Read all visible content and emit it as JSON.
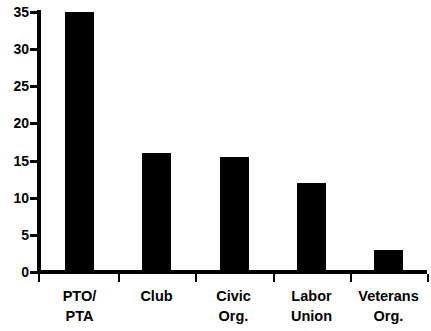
{
  "chart_data": {
    "type": "bar",
    "title": "",
    "subtitle": "",
    "xlabel": "",
    "ylabel": "",
    "categories": [
      "PTO/ PTA",
      "Club",
      "Civic Org.",
      "Labor Union",
      "Veterans Org."
    ],
    "category_lines": [
      {
        "line1": "PTO/",
        "line2": "PTA"
      },
      {
        "line1": "Club",
        "line2": ""
      },
      {
        "line1": "Civic",
        "line2": "Org."
      },
      {
        "line1": "Labor",
        "line2": "Union"
      },
      {
        "line1": "Veterans",
        "line2": "Org."
      }
    ],
    "values": [
      35,
      16,
      15.5,
      12,
      3
    ],
    "ylim": [
      0,
      35
    ],
    "yticks": [
      0,
      5,
      10,
      15,
      20,
      25,
      30,
      35
    ],
    "ytick_labels": [
      "0",
      "5",
      "10",
      "15",
      "20",
      "25",
      "30",
      "35"
    ],
    "grid": false,
    "legend": null,
    "bar_color": "#000000",
    "axis_color": "#000000",
    "background_color": "#ffffff"
  }
}
